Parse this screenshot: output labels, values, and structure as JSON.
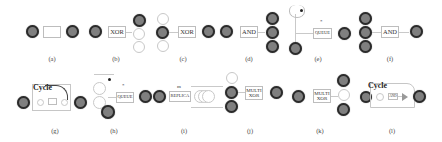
{
  "panels": [
    {
      "id": "a",
      "caption": "(a)",
      "box_label": ""
    },
    {
      "id": "b",
      "caption": "(b)",
      "box_label": "XOR"
    },
    {
      "id": "c",
      "caption": "(c)",
      "box_label": "XOR"
    },
    {
      "id": "d",
      "caption": "(d)",
      "box_label": "AND"
    },
    {
      "id": "e",
      "caption": "(e)",
      "box_label": "QUEUE",
      "marker": "*"
    },
    {
      "id": "f",
      "caption": "(f)",
      "box_label": "AND"
    },
    {
      "id": "g",
      "caption": "(g)",
      "cycle_label": "Cycle"
    },
    {
      "id": "h",
      "caption": "(h)",
      "box_label": "QUEUE",
      "marker": "*"
    },
    {
      "id": "i",
      "caption": "(i)",
      "box_label": "REPLICA",
      "marker": "m"
    },
    {
      "id": "j",
      "caption": "(j)",
      "box_label": "MULTI XOR"
    },
    {
      "id": "k",
      "caption": "(k)",
      "box_label": "MULTI XOR"
    },
    {
      "id": "l",
      "caption": "(l)",
      "cycle_label": "Cycle",
      "box_label": "AND"
    }
  ],
  "colors": {
    "filled_node": "#7f7f7f",
    "node_border": "#2b2b2b",
    "line": "#c9c9c9"
  }
}
